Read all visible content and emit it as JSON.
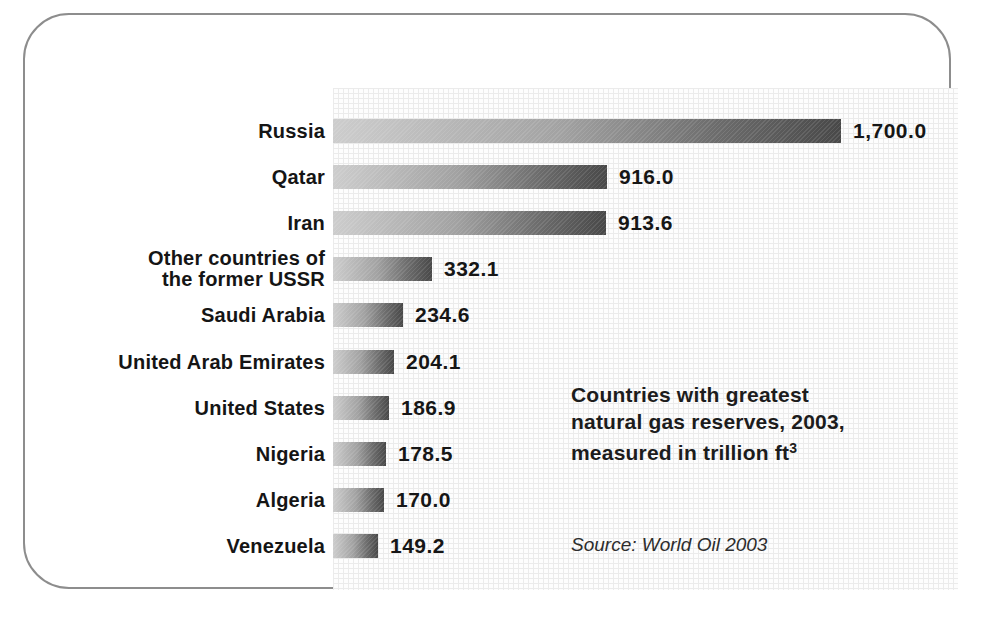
{
  "figure": {
    "border_color": "#8d8d8d",
    "plot_background": "#fdfdfd",
    "grid_line_color": "#cfcfcf",
    "bar_gradient_start": "#cdcdcd",
    "bar_gradient_end": "#484848",
    "text_color": "#1c1c1c"
  },
  "annotation": {
    "line1": "Countries with greatest",
    "line2": "natural gas reserves, 2003,",
    "line3": "measured in trillion ft",
    "line3_sup": "3"
  },
  "source_label": "Source: World Oil 2003",
  "chart_data": {
    "type": "bar",
    "orientation": "horizontal",
    "source": "Source: World Oil 2003",
    "xlabel": "",
    "ylabel": "",
    "xlim": [
      0,
      1870
    ],
    "grid": true,
    "legend": false,
    "categories": [
      "Russia",
      "Qatar",
      "Iran",
      "Other countries of the former USSR",
      "Saudi Arabia",
      "United Arab Emirates",
      "United States",
      "Nigeria",
      "Algeria",
      "Venezuela"
    ],
    "category_display": [
      "Russia",
      "Qatar",
      "Iran",
      "Other countries of\nthe former USSR",
      "Saudi Arabia",
      "United Arab Emirates",
      "United States",
      "Nigeria",
      "Algeria",
      "Venezuela"
    ],
    "values": [
      1700.0,
      916.0,
      913.6,
      332.1,
      234.6,
      204.1,
      186.9,
      178.5,
      170.0,
      149.2
    ],
    "value_labels": [
      "1,700.0",
      "916.0",
      "913.6",
      "332.1",
      "234.6",
      "204.1",
      "186.9",
      "178.5",
      "170.0",
      "149.2"
    ]
  }
}
